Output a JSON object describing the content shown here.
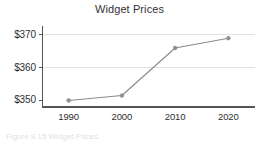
{
  "chart_data": {
    "type": "line",
    "title": "Widget Prices",
    "xlabel": "",
    "ylabel": "",
    "categories": [
      "1990",
      "2000",
      "2010",
      "2020"
    ],
    "x": [
      1990,
      2000,
      2010,
      2020
    ],
    "values": [
      350.0,
      351.5,
      366.0,
      369.0
    ],
    "series": [
      {
        "name": "Widget Prices",
        "values": [
          350.0,
          351.5,
          366.0,
          369.0
        ]
      }
    ],
    "ylim": [
      348.0,
      371.5
    ],
    "xlim": [
      1985,
      2025
    ],
    "ytick_labels": [
      "$350",
      "$360",
      "$370"
    ],
    "ytick_values": [
      350,
      360,
      370
    ],
    "xtick_labels": [
      "1990",
      "2000",
      "2010",
      "2020"
    ],
    "grid": true,
    "grid_axis": "y",
    "legend": false,
    "legend_position": "none",
    "marker": "circle",
    "line_color": "#8a8a8a",
    "marker_color": "#8f8f8f",
    "grid_color": "#e2e2e2",
    "axis_color": "#555555"
  },
  "figure": {
    "caption": "Figure 8.15    Widget Prices"
  }
}
